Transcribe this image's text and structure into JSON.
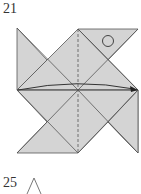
{
  "steps": [
    {
      "number": "21"
    },
    {
      "number": "25"
    }
  ],
  "colors": {
    "paper": "#d4d4d4",
    "line": "#555555",
    "background": "#ffffff"
  },
  "diagram": {
    "markers": [
      "valley-fold-dashed-line",
      "fold-arrow",
      "eye-circle"
    ]
  }
}
